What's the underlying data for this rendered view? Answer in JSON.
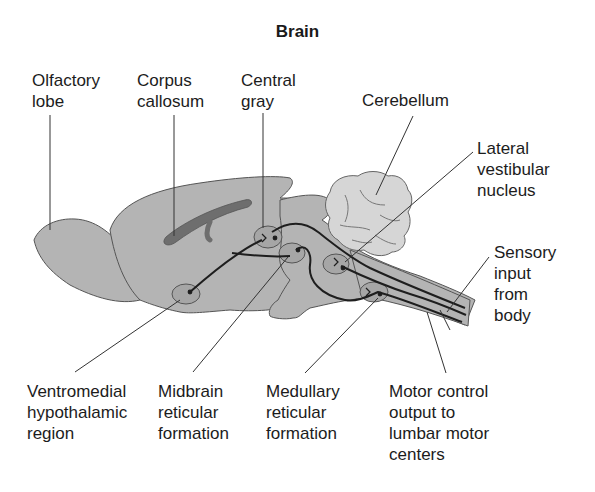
{
  "title": "Brain",
  "labels": {
    "olfactory_lobe": "Olfactory\nlobe",
    "corpus_callosum": "Corpus\ncallosum",
    "central_gray": "Central\ngray",
    "cerebellum": "Cerebellum",
    "lateral_vestibular_nucleus": "Lateral\nvestibular\nnucleus",
    "sensory_input": "Sensory\ninput\nfrom\nbody",
    "ventromedial_hypothalamic_region": "Ventromedial\nhypothalamic\nregion",
    "midbrain_reticular_formation": "Midbrain\nreticular\nformation",
    "medullary_reticular_formation": "Medullary\nreticular\nformation",
    "motor_control_output": "Motor control\noutput to\nlumbar motor\ncenters"
  },
  "colors": {
    "brain_fill": "#b4b4b4",
    "cerebellum_fill": "#d6d6d6",
    "corpus_callosum_fill": "#6e6e6e",
    "nucleus_fill": "#a6a6a6",
    "outline": "#4a4a4a",
    "pathway": "#1e1e1e"
  }
}
